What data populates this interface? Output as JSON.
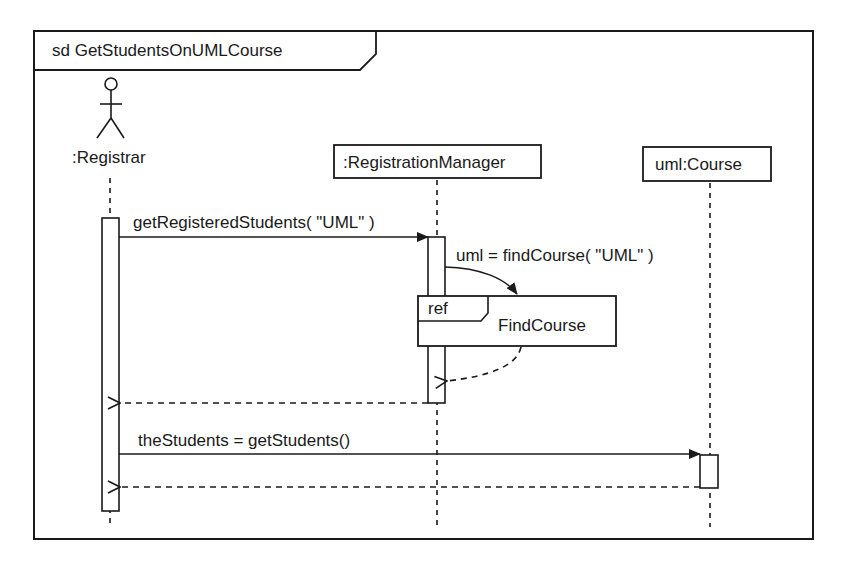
{
  "diagram": {
    "type": "UML sequence diagram",
    "frame": {
      "operator": "sd",
      "name": "GetStudentsOnUMLCourse",
      "title": "sd GetStudentsOnUMLCourse"
    },
    "lifelines": [
      {
        "id": "registrar",
        "label": ":Registrar",
        "kind": "actor"
      },
      {
        "id": "registration-manager",
        "label": ":RegistrationManager",
        "kind": "object"
      },
      {
        "id": "course",
        "label": "uml:Course",
        "kind": "object"
      }
    ],
    "messages": [
      {
        "from": "registrar",
        "to": "registration-manager",
        "kind": "synchronous",
        "label": "getRegisteredStudents( \"UML\" )"
      },
      {
        "from": "registration-manager",
        "to": "ref-findcourse",
        "kind": "synchronous",
        "label": "uml =  findCourse( \"UML\" )"
      },
      {
        "from": "ref-findcourse",
        "to": "registration-manager",
        "kind": "return",
        "label": ""
      },
      {
        "from": "registration-manager",
        "to": "registrar",
        "kind": "return",
        "label": ""
      },
      {
        "from": "registrar",
        "to": "course",
        "kind": "synchronous",
        "label": "theStudents = getStudents()"
      },
      {
        "from": "course",
        "to": "registrar",
        "kind": "return",
        "label": ""
      }
    ],
    "interaction_use": {
      "operator": "ref",
      "name": "FindCourse"
    }
  },
  "colors": {
    "ink": "#1a1a1a",
    "background": "#ffffff"
  }
}
